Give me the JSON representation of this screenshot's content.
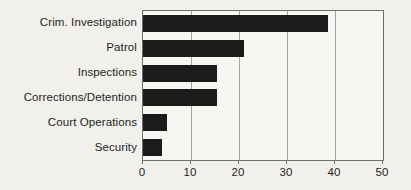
{
  "chart_data": {
    "type": "bar",
    "orientation": "horizontal",
    "title": "",
    "xlabel": "",
    "ylabel": "",
    "categories": [
      "Crim. Investigation",
      "Patrol",
      "Inspections",
      "Corrections/Detention",
      "Court Operations",
      "Security"
    ],
    "values": [
      38.5,
      21,
      15.5,
      15.5,
      5,
      4
    ],
    "xlim": [
      0,
      50
    ],
    "xticks": [
      0,
      10,
      20,
      30,
      40,
      50
    ],
    "grid": true,
    "legend": "none",
    "colors": {
      "bar": "#1b1b1b",
      "frame": "#6e6e6e",
      "gridline": "#a3a19e",
      "background": "#f1f0ed",
      "plot_background": "#f7f6f3",
      "text": "#1f1f1f"
    }
  }
}
